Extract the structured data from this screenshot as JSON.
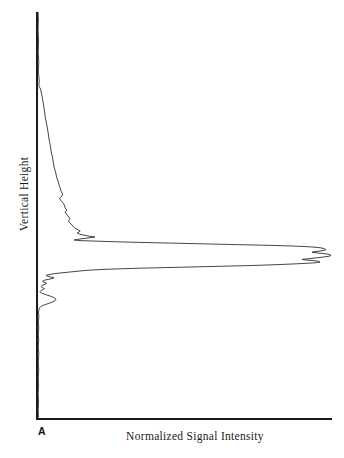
{
  "figure": {
    "panel_letter": "A",
    "background_color": "#ffffff",
    "line_color": "#262626",
    "axis_color": "#1a1a1a"
  },
  "chart_data": {
    "type": "line",
    "title": "",
    "subtitle": "",
    "xlabel": "Normalized Signal Intensity",
    "ylabel": "Vertical Height",
    "orientation": "horizontal-profile",
    "grid": false,
    "legend": null,
    "annotations": [
      {
        "text": "A",
        "role": "panel-label",
        "position": "bottom-left-outside"
      }
    ],
    "axis": {
      "x_origin_px": 37,
      "y_origin_px": 419,
      "y_top_px": 12,
      "x_right_px": 332,
      "xlim": [
        0,
        1
      ],
      "ylim": [
        0,
        1
      ],
      "ticks_x": [],
      "ticks_y": [],
      "tick_labels_x": [],
      "tick_labels_y": []
    },
    "series": [
      {
        "name": "Normalized signal profile",
        "color": "#262626",
        "points_px": [
          [
            38,
            12
          ],
          [
            38.4,
            20
          ],
          [
            38.1,
            30
          ],
          [
            38.6,
            42
          ],
          [
            38.2,
            52
          ],
          [
            38.8,
            62
          ],
          [
            38.3,
            72
          ],
          [
            39.2,
            80
          ],
          [
            38.9,
            86
          ],
          [
            40.5,
            89
          ],
          [
            42.0,
            96
          ],
          [
            43.4,
            104
          ],
          [
            44.6,
            112
          ],
          [
            45.4,
            118
          ],
          [
            47.0,
            126
          ],
          [
            48.2,
            133
          ],
          [
            49.0,
            139
          ],
          [
            50.4,
            146
          ],
          [
            51.2,
            152
          ],
          [
            52.6,
            158
          ],
          [
            53.4,
            163
          ],
          [
            54.0,
            167
          ],
          [
            55.6,
            172
          ],
          [
            56.4,
            176
          ],
          [
            57.2,
            179
          ],
          [
            58.4,
            182
          ],
          [
            59.0,
            185
          ],
          [
            60.2,
            188
          ],
          [
            61.0,
            191
          ],
          [
            62.6,
            194
          ],
          [
            62.0,
            196
          ],
          [
            60.8,
            197
          ],
          [
            59.6,
            198
          ],
          [
            60.4,
            200
          ],
          [
            62.2,
            202
          ],
          [
            63.8,
            204
          ],
          [
            64.6,
            206
          ],
          [
            65.2,
            208
          ],
          [
            66.8,
            210
          ],
          [
            66.0,
            211
          ],
          [
            65.0,
            212
          ],
          [
            66.4,
            214
          ],
          [
            68.0,
            216
          ],
          [
            69.4,
            218
          ],
          [
            70.2,
            219
          ],
          [
            69.4,
            220
          ],
          [
            68.4,
            221
          ],
          [
            70.0,
            223
          ],
          [
            72.0,
            225
          ],
          [
            73.6,
            227
          ],
          [
            74.8,
            228
          ],
          [
            76.4,
            229
          ],
          [
            78.6,
            230
          ],
          [
            80.2,
            231
          ],
          [
            79.0,
            232
          ],
          [
            77.2,
            233
          ],
          [
            79.4,
            234
          ],
          [
            83.0,
            235
          ],
          [
            88.0,
            236
          ],
          [
            95.0,
            237
          ],
          [
            88.0,
            238
          ],
          [
            80.0,
            239
          ],
          [
            74.0,
            240
          ],
          [
            80.0,
            240.6
          ],
          [
            92.0,
            241
          ],
          [
            110.0,
            241.6
          ],
          [
            140.0,
            242.4
          ],
          [
            175.0,
            243.2
          ],
          [
            210.0,
            244.0
          ],
          [
            245.0,
            244.8
          ],
          [
            272.0,
            245.4
          ],
          [
            292.0,
            246.0
          ],
          [
            306.0,
            246.6
          ],
          [
            315.0,
            247.2
          ],
          [
            321.0,
            247.9
          ],
          [
            324.5,
            248.7
          ],
          [
            326.0,
            249.6
          ],
          [
            324.0,
            250.4
          ],
          [
            320.0,
            251.0
          ],
          [
            315.0,
            251.6
          ],
          [
            312.0,
            252.2
          ],
          [
            316.0,
            252.8
          ],
          [
            322.0,
            253.4
          ],
          [
            327.0,
            254.0
          ],
          [
            330.0,
            254.7
          ],
          [
            331.0,
            255.6
          ],
          [
            328.0,
            256.4
          ],
          [
            322.0,
            257.2
          ],
          [
            315.0,
            258.0
          ],
          [
            308.0,
            258.8
          ],
          [
            302.0,
            259.4
          ],
          [
            306.0,
            260.0
          ],
          [
            313.0,
            260.6
          ],
          [
            318.0,
            261.2
          ],
          [
            320.0,
            262.0
          ],
          [
            315.0,
            262.8
          ],
          [
            305.0,
            263.4
          ],
          [
            292.0,
            264.0
          ],
          [
            278.0,
            264.6
          ],
          [
            262.0,
            265.2
          ],
          [
            240.0,
            265.8
          ],
          [
            215.0,
            266.4
          ],
          [
            190.0,
            267.0
          ],
          [
            165.0,
            267.6
          ],
          [
            140.0,
            268.2
          ],
          [
            120.0,
            268.8
          ],
          [
            104.0,
            269.4
          ],
          [
            92.0,
            270.0
          ],
          [
            84.0,
            270.6
          ],
          [
            78.0,
            271.2
          ],
          [
            72.0,
            271.8
          ],
          [
            66.0,
            272.4
          ],
          [
            60.0,
            273.0
          ],
          [
            55.0,
            273.6
          ],
          [
            51.0,
            274.2
          ],
          [
            48.0,
            274.8
          ],
          [
            46.0,
            275.4
          ],
          [
            47.5,
            276.2
          ],
          [
            51.0,
            277.0
          ],
          [
            54.0,
            277.8
          ],
          [
            52.0,
            278.6
          ],
          [
            48.0,
            279.4
          ],
          [
            44.5,
            280.2
          ],
          [
            42.5,
            281.2
          ],
          [
            44.0,
            282.2
          ],
          [
            46.5,
            283.2
          ],
          [
            45.0,
            284.2
          ],
          [
            42.5,
            285.2
          ],
          [
            41.0,
            286.4
          ],
          [
            42.5,
            287.6
          ],
          [
            44.5,
            288.6
          ],
          [
            43.0,
            289.6
          ],
          [
            41.0,
            290.6
          ],
          [
            39.8,
            291.8
          ],
          [
            41.5,
            293.0
          ],
          [
            45.0,
            294.4
          ],
          [
            50.0,
            296.0
          ],
          [
            54.0,
            297.6
          ],
          [
            56.0,
            299.2
          ],
          [
            55.0,
            300.8
          ],
          [
            52.0,
            302.2
          ],
          [
            48.0,
            303.6
          ],
          [
            44.0,
            305.0
          ],
          [
            41.0,
            306.4
          ],
          [
            39.5,
            308.0
          ],
          [
            38.8,
            310.0
          ],
          [
            38.5,
            313.0
          ],
          [
            38.9,
            317.0
          ],
          [
            38.4,
            322.0
          ],
          [
            38.8,
            328.0
          ],
          [
            38.3,
            334.0
          ],
          [
            38.7,
            340.0
          ],
          [
            38.3,
            347.0
          ],
          [
            38.8,
            354.0
          ],
          [
            38.3,
            362.0
          ],
          [
            38.7,
            370.0
          ],
          [
            38.3,
            378.0
          ],
          [
            38.6,
            386.0
          ],
          [
            38.2,
            394.0
          ],
          [
            38.6,
            402.0
          ],
          [
            38.2,
            410.0
          ],
          [
            38.5,
            417.0
          ]
        ]
      }
    ]
  }
}
